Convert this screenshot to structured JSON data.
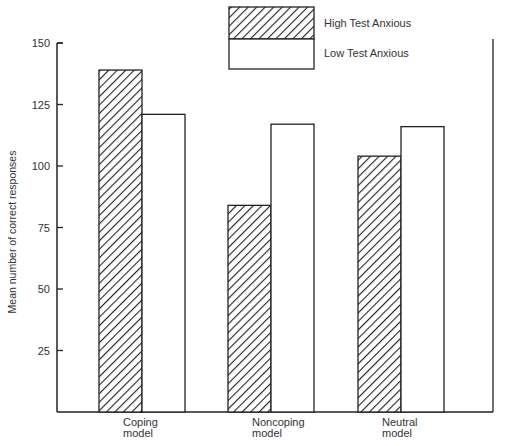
{
  "chart_data": {
    "type": "bar",
    "title": "",
    "xlabel": "",
    "ylabel": "Mean number of correct responses",
    "ylim": [
      0,
      150
    ],
    "yticks": [
      25,
      50,
      75,
      100,
      125,
      150
    ],
    "grid": false,
    "legend_position": "top-right",
    "categories": [
      "Coping model",
      "Noncoping model",
      "Neutral model"
    ],
    "category_lines": [
      [
        "Coping",
        "model"
      ],
      [
        "Noncoping",
        "model"
      ],
      [
        "Neutral",
        "model"
      ]
    ],
    "series": [
      {
        "name": "High Test Anxious",
        "pattern": "diagonal-hatch",
        "values": [
          139,
          84,
          104
        ]
      },
      {
        "name": "Low Test Anxious",
        "pattern": "white",
        "values": [
          121,
          117,
          116
        ]
      }
    ]
  },
  "colors": {
    "stroke": "#222222",
    "fill_low": "#ffffff"
  }
}
